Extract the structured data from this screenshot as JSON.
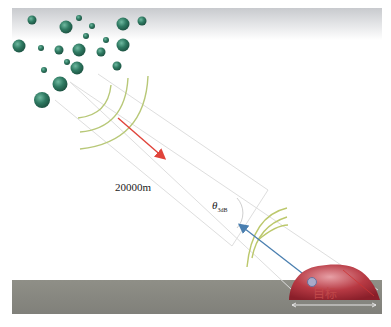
{
  "diagram": {
    "title": "",
    "distance_label": "20000m",
    "beam_angle_symbol": "θ",
    "beam_angle_subscript": "3dB",
    "target_label": "目标",
    "elements": {
      "cloud_particles": "rain/cloud droplets (green spheres) at upper left",
      "transmitted_wave": "red arrow from radar toward particles",
      "return_wave": "blue arrow from target toward beam",
      "ground": "gray ground band",
      "target": "red dome-shaped target on ground"
    },
    "colors": {
      "particle": "#2f7a62",
      "sky_band": "#d6d8dc",
      "ground": "#8a8a82",
      "target": "#b83a44",
      "red_arrow": "#e0433a",
      "blue_arrow": "#4a7fb0",
      "wavefront": "#b8c878",
      "beam_lines": "#dcdcdc"
    }
  }
}
